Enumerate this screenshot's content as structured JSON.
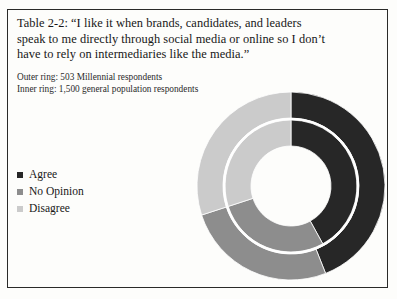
{
  "title": "Table 2-2: “I like it when brands, candidates, and leaders speak to me directly through social media or online so I don’t have to rely on intermediaries like the media.”",
  "notes": {
    "outer_ring": "Outer ring: 503 Millennial respondents",
    "inner_ring": "Inner ring: 1,500 general population respondents"
  },
  "colors": {
    "agree": "#272727",
    "no_opinion": "#8d8d8d",
    "disagree": "#cbcbcb",
    "background": "#fdfdfb",
    "frame": "#2a2a28",
    "text": "#171717",
    "separator": "#ffffff"
  },
  "legend": {
    "items": [
      {
        "label": "Agree",
        "color_key": "agree"
      },
      {
        "label": "No Opinion",
        "color_key": "no_opinion"
      },
      {
        "label": "Disagree",
        "color_key": "disagree"
      }
    ]
  },
  "chart_data": {
    "type": "pie",
    "variant": "nested-donut",
    "title": "Table 2-2: “I like it when brands, candidates, and leaders speak to me directly through social media or online so I don’t have to rely on intermediaries like the media.”",
    "categories": [
      "Agree",
      "No Opinion",
      "Disagree"
    ],
    "start_angle_deg": 0,
    "direction": "clockwise",
    "legend_position": "left",
    "rings": [
      {
        "name": "Outer ring",
        "description": "503 Millennial respondents",
        "n": 503,
        "values": [
          44,
          26,
          30
        ],
        "unit": "percent"
      },
      {
        "name": "Inner ring",
        "description": "1,500 general population respondents",
        "n": 1500,
        "values": [
          42,
          28,
          30
        ],
        "unit": "percent"
      }
    ]
  },
  "geometry": {
    "cx": 101,
    "cy": 101,
    "outer_ring_r_outer": 94,
    "outer_ring_r_inner": 68,
    "inner_ring_r_outer": 66,
    "inner_ring_r_inner": 40
  }
}
